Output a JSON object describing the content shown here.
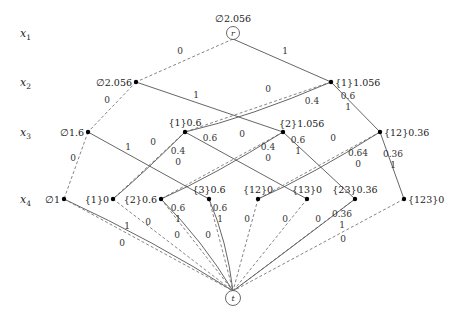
{
  "figure": {
    "levels": [
      {
        "name": "x",
        "sub": "1",
        "y": 33
      },
      {
        "name": "x",
        "sub": "2",
        "y": 82
      },
      {
        "name": "x",
        "sub": "3",
        "y": 132
      },
      {
        "name": "x",
        "sub": "4",
        "y": 199
      }
    ],
    "root": {
      "id": "r",
      "label": "r",
      "text": "∅2.056",
      "x": 233,
      "y": 33
    },
    "terminal": {
      "id": "t",
      "label": "t",
      "x": 233,
      "y": 298
    },
    "nodes": [
      {
        "id": "x2_empty",
        "text": "∅2.056",
        "x": 136,
        "y": 82,
        "label_side": "left"
      },
      {
        "id": "x2_1",
        "text": "{1}1.056",
        "x": 331,
        "y": 82,
        "label_side": "right"
      },
      {
        "id": "x3_empty",
        "text": "∅1.6",
        "x": 88,
        "y": 132,
        "label_side": "left"
      },
      {
        "id": "x3_1",
        "text": "{1}0.6",
        "x": 185,
        "y": 132,
        "label_side": "above"
      },
      {
        "id": "x3_2",
        "text": "{2}1.056",
        "x": 283,
        "y": 132,
        "label_side": "above-right"
      },
      {
        "id": "x3_12",
        "text": "{12}0.36",
        "x": 380,
        "y": 132,
        "label_side": "right"
      },
      {
        "id": "x4_empty",
        "text": "∅1",
        "x": 64,
        "y": 199,
        "label_side": "left"
      },
      {
        "id": "x4_1",
        "text": "{1}0",
        "x": 113,
        "y": 199,
        "label_side": "left"
      },
      {
        "id": "x4_2",
        "text": "{2}0.6",
        "x": 161,
        "y": 199,
        "label_side": "left"
      },
      {
        "id": "x4_3",
        "text": "{3}0.6",
        "x": 209,
        "y": 199,
        "label_side": "above"
      },
      {
        "id": "x4_12",
        "text": "{12}0",
        "x": 258,
        "y": 199,
        "label_side": "above"
      },
      {
        "id": "x4_13",
        "text": "{13}0",
        "x": 307,
        "y": 199,
        "label_side": "above"
      },
      {
        "id": "x4_23",
        "text": "{23}0.36",
        "x": 355,
        "y": 199,
        "label_side": "above"
      },
      {
        "id": "x4_123",
        "text": "{123}0",
        "x": 404,
        "y": 199,
        "label_side": "right"
      }
    ],
    "edges": [
      {
        "from": "r",
        "to": "x2_empty",
        "style": "dashed",
        "weights": [
          "0"
        ],
        "lx": 180,
        "ly": 54
      },
      {
        "from": "r",
        "to": "x2_1",
        "style": "solid",
        "weights": [
          "1"
        ],
        "lx": 285,
        "ly": 54
      },
      {
        "from": "x2_empty",
        "to": "x3_empty",
        "style": "dashed",
        "weights": [
          "0"
        ],
        "lx": 107,
        "ly": 103
      },
      {
        "from": "x2_empty",
        "to": "x3_2",
        "style": "solid",
        "weights": [
          "1"
        ],
        "lx": 196,
        "ly": 98
      },
      {
        "from": "x2_1",
        "to": "x3_1",
        "style": "dashed",
        "weights": [
          "0"
        ],
        "lx": 268,
        "ly": 92
      },
      {
        "from": "x2_1",
        "to": "x3_1",
        "style": "solid",
        "weights": [
          "0.4"
        ],
        "lx": 312,
        "ly": 104
      },
      {
        "from": "x2_1",
        "to": "x3_12",
        "style": "solid",
        "weights": [
          "0.6",
          "1"
        ],
        "lx": 348,
        "ly": 99
      },
      {
        "from": "x3_empty",
        "to": "x4_empty",
        "style": "dashed",
        "weights": [
          "0"
        ],
        "lx": 73,
        "ly": 161
      },
      {
        "from": "x3_empty",
        "to": "x4_3",
        "style": "solid",
        "weights": [
          "1"
        ],
        "lx": 128,
        "ly": 150
      },
      {
        "from": "x3_1",
        "to": "x4_1",
        "style": "dashed",
        "weights": [
          "0"
        ],
        "lx": 153,
        "ly": 145
      },
      {
        "from": "x3_1",
        "to": "x4_1",
        "style": "solid",
        "weights": [
          "0.4",
          "0"
        ],
        "lx": 178,
        "ly": 154
      },
      {
        "from": "x3_1",
        "to": "x4_13",
        "style": "solid",
        "weights": [
          "0.6"
        ],
        "lx": 210,
        "ly": 141
      },
      {
        "from": "x3_2",
        "to": "x4_2",
        "style": "dashed",
        "weights": [
          "0"
        ],
        "lx": 242,
        "ly": 137
      },
      {
        "from": "x3_2",
        "to": "x4_2",
        "style": "solid",
        "weights": [
          "0.4",
          "0"
        ],
        "lx": 268,
        "ly": 150
      },
      {
        "from": "x3_2",
        "to": "x4_23",
        "style": "solid",
        "weights": [
          "0.6",
          "1"
        ],
        "lx": 298,
        "ly": 143
      },
      {
        "from": "x3_12",
        "to": "x4_12",
        "style": "dashed",
        "weights": [
          "0"
        ],
        "lx": 333,
        "ly": 141
      },
      {
        "from": "x3_12",
        "to": "x4_12",
        "style": "solid",
        "weights": [
          "0.64",
          "0"
        ],
        "lx": 358,
        "ly": 156
      },
      {
        "from": "x3_12",
        "to": "x4_123",
        "style": "solid",
        "weights": [
          "0.36",
          "1"
        ],
        "lx": 393,
        "ly": 157
      },
      {
        "from": "x4_empty",
        "to": "t",
        "style": "solid",
        "weights": [
          "1"
        ],
        "lx": 127,
        "ly": 229
      },
      {
        "from": "x4_empty",
        "to": "t",
        "style": "dashed",
        "weights": [
          "0"
        ],
        "lx": 122,
        "ly": 246
      },
      {
        "from": "x4_1",
        "to": "t",
        "style": "dashed",
        "weights": [
          "0"
        ],
        "lx": 148,
        "ly": 225
      },
      {
        "from": "x4_2",
        "to": "t",
        "style": "solid",
        "weights": [
          "0.6",
          "1"
        ],
        "lx": 178,
        "ly": 211
      },
      {
        "from": "x4_2",
        "to": "t",
        "style": "dashed",
        "weights": [
          "0"
        ],
        "lx": 177,
        "ly": 238
      },
      {
        "from": "x4_3",
        "to": "t",
        "style": "solid",
        "weights": [
          "0.6",
          "1"
        ],
        "lx": 220,
        "ly": 211
      },
      {
        "from": "x4_3",
        "to": "t",
        "style": "dashed",
        "weights": [
          "0"
        ],
        "lx": 208,
        "ly": 238
      },
      {
        "from": "x4_12",
        "to": "t",
        "style": "dashed",
        "weights": [
          "0"
        ],
        "lx": 247,
        "ly": 222
      },
      {
        "from": "x4_13",
        "to": "t",
        "style": "dashed",
        "weights": [
          "0"
        ],
        "lx": 285,
        "ly": 222
      },
      {
        "from": "x4_23",
        "to": "t",
        "style": "dashed",
        "weights": [
          "0"
        ],
        "lx": 318,
        "ly": 222
      },
      {
        "from": "x4_23",
        "to": "t",
        "style": "solid",
        "weights": [
          "0.36",
          "1"
        ],
        "lx": 342,
        "ly": 217
      },
      {
        "from": "x4_123",
        "to": "t",
        "style": "dashed",
        "weights": [
          "0"
        ],
        "lx": 343,
        "ly": 242
      }
    ]
  }
}
